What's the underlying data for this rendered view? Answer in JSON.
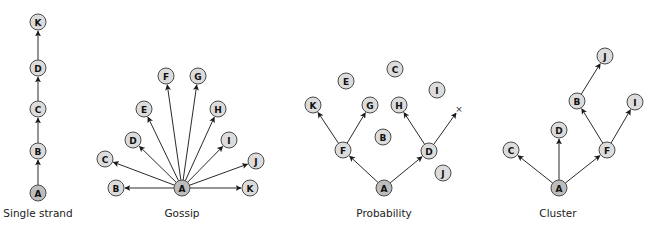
{
  "style": {
    "node_fill": "#dcdcdc",
    "root_fill": "#bdbdbd",
    "node_stroke": "#4a4a4a",
    "edge_color": "#2a2a2a",
    "node_radius": 8
  },
  "diagrams": [
    {
      "id": "single-strand",
      "caption": "Single strand",
      "caption_pos": [
        38,
        217
      ],
      "nodes": [
        {
          "label": "A",
          "x": 38,
          "y": 193,
          "root": true
        },
        {
          "label": "B",
          "x": 38,
          "y": 151
        },
        {
          "label": "C",
          "x": 38,
          "y": 109
        },
        {
          "label": "D",
          "x": 38,
          "y": 68
        },
        {
          "label": "K",
          "x": 38,
          "y": 22
        }
      ],
      "edges": [
        [
          "A",
          "B"
        ],
        [
          "B",
          "C"
        ],
        [
          "C",
          "D"
        ],
        [
          "D",
          "K"
        ]
      ]
    },
    {
      "id": "gossip",
      "caption": "Gossip",
      "caption_pos": [
        182,
        217
      ],
      "nodes": [
        {
          "label": "A",
          "x": 182,
          "y": 188,
          "root": true
        },
        {
          "label": "B",
          "x": 116,
          "y": 188
        },
        {
          "label": "C",
          "x": 105,
          "y": 159
        },
        {
          "label": "D",
          "x": 133,
          "y": 140
        },
        {
          "label": "E",
          "x": 144,
          "y": 109
        },
        {
          "label": "F",
          "x": 166,
          "y": 76
        },
        {
          "label": "G",
          "x": 198,
          "y": 76
        },
        {
          "label": "H",
          "x": 218,
          "y": 109
        },
        {
          "label": "I",
          "x": 229,
          "y": 140
        },
        {
          "label": "J",
          "x": 256,
          "y": 161
        },
        {
          "label": "K",
          "x": 250,
          "y": 188
        }
      ],
      "edges": [
        [
          "A",
          "B"
        ],
        [
          "A",
          "C"
        ],
        [
          "A",
          "D"
        ],
        [
          "A",
          "E"
        ],
        [
          "A",
          "F"
        ],
        [
          "A",
          "G"
        ],
        [
          "A",
          "H"
        ],
        [
          "A",
          "I"
        ],
        [
          "A",
          "J"
        ],
        [
          "A",
          "K"
        ]
      ]
    },
    {
      "id": "probability",
      "caption": "Probability",
      "caption_pos": [
        384,
        217
      ],
      "nodes": [
        {
          "label": "A",
          "x": 384,
          "y": 188,
          "root": true
        },
        {
          "label": "B",
          "x": 383,
          "y": 137
        },
        {
          "label": "C",
          "x": 395,
          "y": 69
        },
        {
          "label": "D",
          "x": 429,
          "y": 151
        },
        {
          "label": "E",
          "x": 346,
          "y": 81
        },
        {
          "label": "F",
          "x": 343,
          "y": 150
        },
        {
          "label": "G",
          "x": 370,
          "y": 105
        },
        {
          "label": "H",
          "x": 399,
          "y": 105
        },
        {
          "label": "I",
          "x": 437,
          "y": 90
        },
        {
          "label": "J",
          "x": 443,
          "y": 173
        },
        {
          "label": "K",
          "x": 313,
          "y": 105
        }
      ],
      "markers": [
        {
          "label": "×",
          "x": 459,
          "y": 109
        }
      ],
      "edges": [
        [
          "A",
          "F"
        ],
        [
          "A",
          "D"
        ],
        [
          "F",
          "K"
        ],
        [
          "F",
          "G"
        ],
        [
          "D",
          "H"
        ],
        [
          "D",
          "×"
        ]
      ]
    },
    {
      "id": "cluster",
      "caption": "Cluster",
      "caption_pos": [
        558,
        217
      ],
      "nodes": [
        {
          "label": "A",
          "x": 559,
          "y": 188,
          "root": true
        },
        {
          "label": "B",
          "x": 577,
          "y": 101
        },
        {
          "label": "C",
          "x": 511,
          "y": 150
        },
        {
          "label": "D",
          "x": 559,
          "y": 130
        },
        {
          "label": "F",
          "x": 607,
          "y": 150
        },
        {
          "label": "I",
          "x": 635,
          "y": 102
        },
        {
          "label": "J",
          "x": 605,
          "y": 56
        }
      ],
      "edges": [
        [
          "A",
          "C"
        ],
        [
          "A",
          "D"
        ],
        [
          "A",
          "F"
        ],
        [
          "F",
          "B"
        ],
        [
          "F",
          "I"
        ],
        [
          "B",
          "J"
        ]
      ]
    }
  ]
}
